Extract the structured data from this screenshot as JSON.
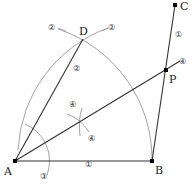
{
  "diagram": {
    "points": {
      "A": {
        "label": "A",
        "x": 15,
        "y": 161
      },
      "B": {
        "label": "B",
        "x": 152,
        "y": 161
      },
      "C": {
        "label": "C",
        "x": 175,
        "y": 5
      },
      "D": {
        "label": "D",
        "x": 83,
        "y": 39
      },
      "P": {
        "label": "P",
        "x": 166,
        "y": 70
      }
    },
    "step_markers": {
      "step1_AB": "①",
      "step1_BC": "①",
      "step2_left": "②",
      "step2_right": "②",
      "step2_AD": "②",
      "step3_arc": "③",
      "step4_top": "④",
      "step4_bottom": "④",
      "step4_ray": "④"
    },
    "colors": {
      "line": "#333333",
      "arc": "#8a8a8a",
      "point": "#000000"
    }
  }
}
